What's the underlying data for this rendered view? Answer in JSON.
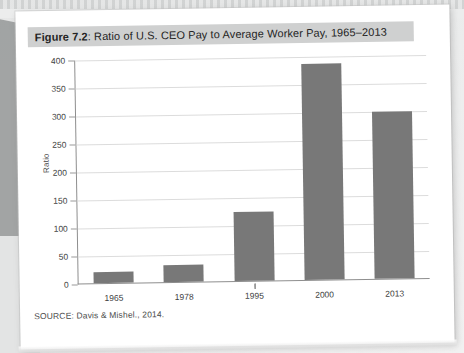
{
  "figure": {
    "label": "Figure 7.2",
    "caption_rest": ": Ratio of U.S. CEO Pay to Average Worker Pay, 1965–2013",
    "source": "SOURCE: Davis & Mishel., 2014.",
    "banner_color": "#cfd0d0",
    "bar_color": "#787878",
    "page_color": "#ffffff",
    "background_color": "#eceded"
  },
  "chart_data": {
    "type": "bar",
    "title": "Figure 7.2: Ratio of U.S. CEO Pay to Average Worker Pay, 1965–2013",
    "categories": [
      "1965",
      "1978",
      "1995",
      "2000",
      "2013"
    ],
    "values": [
      20,
      30,
      123,
      386,
      299
    ],
    "xlabel": "",
    "ylabel": "Ratio",
    "ylim": [
      0,
      400
    ],
    "yticks": [
      0,
      50,
      100,
      150,
      200,
      250,
      300,
      350,
      400
    ],
    "ytick_labels": [
      "0",
      "50",
      "100",
      "150",
      "200",
      "250",
      "300",
      "350",
      "400"
    ],
    "grid": true,
    "legend": false,
    "series": [
      {
        "name": "Ratio of CEO pay to average worker pay",
        "values": [
          20,
          30,
          123,
          386,
          299
        ]
      }
    ]
  }
}
